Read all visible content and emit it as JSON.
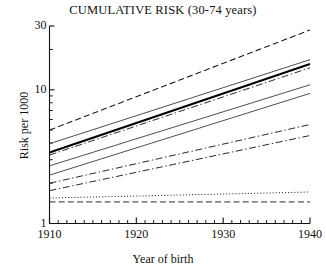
{
  "chart_data": {
    "type": "line",
    "title": "CUMULATIVE RISK (30-74 years)",
    "xlabel": "Year of birth",
    "ylabel": "Risk per 1000",
    "xlim": [
      1910,
      1940
    ],
    "ylim": [
      1,
      30
    ],
    "yscale": "log",
    "grid": false,
    "legend": "none",
    "xticks_major": [
      1910,
      1920,
      1930,
      1940
    ],
    "xtick_labels": [
      "1910",
      "1920",
      "1930",
      "1940"
    ],
    "xticks_minor_step": 1,
    "yticks_major": [
      1,
      10,
      30
    ],
    "ytick_labels": [
      "1",
      "10",
      "30"
    ],
    "yticks_minor": [
      2,
      3,
      4,
      5,
      6,
      7,
      8,
      9,
      20
    ],
    "x": [
      1910,
      1940
    ],
    "series": [
      {
        "name": "series-1",
        "style": "dashed",
        "width": 1.1,
        "color": "#1a1a1a",
        "values": [
          5.0,
          28.0
        ]
      },
      {
        "name": "series-2",
        "style": "solid",
        "width": 0.9,
        "color": "#3a3a3a",
        "values": [
          3.95,
          16.8
        ]
      },
      {
        "name": "series-3",
        "style": "solid",
        "width": 2.0,
        "color": "#000000",
        "values": [
          3.4,
          15.6
        ]
      },
      {
        "name": "series-4",
        "style": "dashdot",
        "width": 1.0,
        "color": "#2a2a2a",
        "values": [
          3.25,
          14.6
        ]
      },
      {
        "name": "series-5",
        "style": "solid",
        "width": 0.9,
        "color": "#3a3a3a",
        "values": [
          2.7,
          10.9
        ]
      },
      {
        "name": "series-6",
        "style": "solid",
        "width": 0.9,
        "color": "#3a3a3a",
        "values": [
          2.3,
          9.4
        ]
      },
      {
        "name": "series-7",
        "style": "dashdot",
        "width": 1.0,
        "color": "#2a2a2a",
        "values": [
          2.0,
          5.5
        ]
      },
      {
        "name": "series-8",
        "style": "dashdot",
        "width": 1.0,
        "color": "#2a2a2a",
        "values": [
          1.76,
          4.55
        ]
      },
      {
        "name": "series-9",
        "style": "dotted",
        "width": 1.0,
        "color": "#2a2a2a",
        "values": [
          1.55,
          1.72
        ]
      },
      {
        "name": "series-10",
        "style": "dashed",
        "width": 1.0,
        "color": "#2a2a2a",
        "values": [
          1.45,
          1.45
        ]
      }
    ]
  }
}
